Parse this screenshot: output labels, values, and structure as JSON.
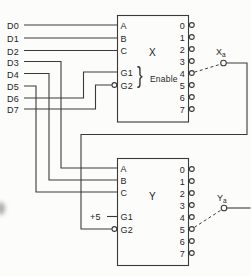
{
  "figure": {
    "description_colors": {
      "background": "#fcfcfa",
      "line": "#3a3a3a",
      "text": "#262626"
    }
  },
  "data_inputs": [
    "D0",
    "D1",
    "D2",
    "D3",
    "D4",
    "D5",
    "D6",
    "D7"
  ],
  "decoder_x": {
    "title": "X",
    "select_pins": [
      "A",
      "B",
      "C"
    ],
    "enable_pins": [
      "G1",
      "G2"
    ],
    "enable_brace": "}",
    "enable_group_label": "Enable",
    "outputs": [
      "0",
      "1",
      "2",
      "3",
      "4",
      "5",
      "6",
      "7"
    ],
    "selected_output": "4",
    "terminal": {
      "base": "X",
      "sub": "a"
    }
  },
  "decoder_y": {
    "title": "Y",
    "select_pins": [
      "A",
      "B",
      "C"
    ],
    "enable_pins": [
      "G1",
      "G2"
    ],
    "supply_label": "+5",
    "outputs": [
      "0",
      "1",
      "2",
      "3",
      "4",
      "5",
      "6",
      "7"
    ],
    "selected_output": "5",
    "terminal": {
      "base": "Y",
      "sub": "a"
    }
  }
}
